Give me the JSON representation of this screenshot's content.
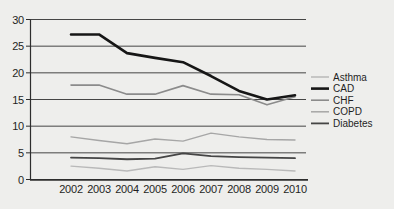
{
  "figure": {
    "background": "#eeeeec"
  },
  "chart_data": {
    "type": "line",
    "title": "",
    "xlabel": "",
    "ylabel": "",
    "x": [
      2002,
      2003,
      2004,
      2005,
      2006,
      2007,
      2008,
      2009,
      2010
    ],
    "ylim": [
      0,
      30
    ],
    "yticks": [
      0,
      5,
      10,
      15,
      20,
      25,
      30
    ],
    "grid": "horizontal",
    "legend_position": "right",
    "axis_color": "#2d2d2d",
    "grid_color": "#454545",
    "text_color": "#1f1f1f",
    "series": [
      {
        "name": "Asthma",
        "color": "#b9b9b9",
        "width": 1.4,
        "values": [
          2.5,
          2.1,
          1.6,
          2.4,
          1.9,
          2.6,
          2.1,
          1.9,
          1.6
        ]
      },
      {
        "name": "CAD",
        "color": "#161616",
        "width": 2.6,
        "values": [
          27.2,
          27.2,
          23.7,
          22.8,
          22.0,
          19.4,
          16.6,
          15.0,
          15.8
        ]
      },
      {
        "name": "CHF",
        "color": "#8b8b8b",
        "width": 1.6,
        "values": [
          17.7,
          17.7,
          16.0,
          16.0,
          17.6,
          16.0,
          15.9,
          14.0,
          15.5
        ]
      },
      {
        "name": "COPD",
        "color": "#a6a6a6",
        "width": 1.4,
        "values": [
          8.0,
          7.3,
          6.7,
          7.6,
          7.2,
          8.7,
          8.0,
          7.5,
          7.4
        ]
      },
      {
        "name": "Diabetes",
        "color": "#454545",
        "width": 1.8,
        "values": [
          4.1,
          4.0,
          3.8,
          3.9,
          4.9,
          4.4,
          4.2,
          4.1,
          4.0
        ]
      }
    ],
    "draw_order": [
      "Asthma",
      "COPD",
      "CHF",
      "Diabetes",
      "CAD"
    ]
  }
}
